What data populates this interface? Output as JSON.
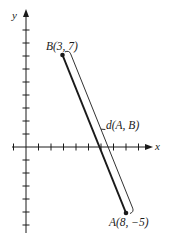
{
  "figure": {
    "type": "distance-between-points-diagram",
    "axes": {
      "x_label": "x",
      "y_label": "y",
      "x_ticks": [
        -1,
        1,
        2,
        3,
        4,
        5,
        6,
        7,
        8,
        9
      ],
      "y_ticks": [
        9,
        8,
        7,
        6,
        5,
        4,
        3,
        2,
        1,
        -1,
        -2,
        -3,
        -4,
        -5,
        -6
      ],
      "x_range": [
        -1.5,
        10
      ],
      "y_range": [
        -6.6,
        10.3
      ]
    },
    "points": {
      "B": {
        "name": "B",
        "x": 3,
        "y": 7,
        "label": "B(3, 7)"
      },
      "A": {
        "name": "A",
        "x": 8,
        "y": -5,
        "label": "A(8, −5)"
      }
    },
    "segment": {
      "from": "B",
      "to": "A"
    },
    "distance_bracket": {
      "label": "d(A, B)"
    },
    "colors": {
      "ink": "#1a1a1a",
      "background": "#ffffff"
    }
  }
}
